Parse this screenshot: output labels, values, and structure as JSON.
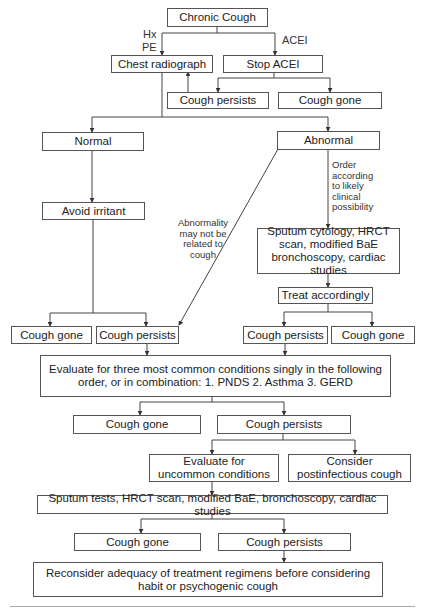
{
  "diagram": {
    "nodes": {
      "chronic_cough": "Chronic Cough",
      "chest_radiograph": "Chest radiograph",
      "stop_acei": "Stop ACEI",
      "acei_cough_persists": "Cough persists",
      "acei_cough_gone": "Cough gone",
      "normal": "Normal",
      "abnormal": "Abnormal",
      "avoid_irritant": "Avoid irritant",
      "abnormal_tests": "Sputum cytology, HRCT scan, modified BaE bronchoscopy, cardiac studies",
      "treat_accordingly": "Treat accordingly",
      "normal_cough_gone": "Cough gone",
      "normal_cough_persists": "Cough persists",
      "treat_cough_persists": "Cough persists",
      "treat_cough_gone": "Cough gone",
      "evaluate_common": "Evaluate for three most common conditions singly in the following order, or in combination: 1. PNDS 2. Asthma 3. GERD",
      "common_cough_gone": "Cough gone",
      "common_cough_persists": "Cough persists",
      "evaluate_uncommon": "Evaluate for uncommon conditions",
      "postinfectious": "Consider postinfectious cough",
      "uncommon_tests": "Sputum tests, HRCT scan, modified BaE, bronchoscopy, cardiac studies",
      "final_cough_gone": "Cough gone",
      "final_cough_persists": "Cough persists",
      "reconsider": "Reconsider adequacy of treatment regimens before considering habit or psychogenic cough"
    },
    "edge_labels": {
      "hx": "Hx",
      "pe": "PE",
      "acei": "ACEI",
      "order_by_likelihood": "Order according to likely clinical possibility",
      "abnormality_unrelated": "Abnormality may not be related to cough"
    },
    "colors": {
      "line": "#444444",
      "box_border": "#555555",
      "text": "#222222"
    }
  }
}
